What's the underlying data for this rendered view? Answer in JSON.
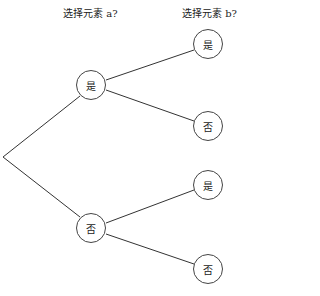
{
  "headers": {
    "level1": "选择元素 a?",
    "level2": "选择元素 b?"
  },
  "tree": {
    "level1": [
      {
        "label": "是",
        "children": [
          {
            "label": "是"
          },
          {
            "label": "否"
          }
        ]
      },
      {
        "label": "否",
        "children": [
          {
            "label": "是"
          },
          {
            "label": "否"
          }
        ]
      }
    ]
  }
}
